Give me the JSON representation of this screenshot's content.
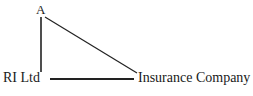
{
  "diagram": {
    "type": "triangle-relationship-diagram",
    "background_color": "#ffffff",
    "stroke_color": "#222222",
    "nodes": [
      {
        "id": "apex",
        "label": "A",
        "x": 41,
        "y": 10
      },
      {
        "id": "ri-ltd",
        "label": "RI Ltd",
        "x": 24,
        "y": 79
      },
      {
        "id": "insurance-company",
        "label": "Insurance Company",
        "x": 192,
        "y": 79
      }
    ],
    "edges": [
      {
        "id": "apex-to-ri-ltd",
        "from": "apex",
        "to": "ri-ltd",
        "x1": 41,
        "y1": 17,
        "x2": 41,
        "y2": 72,
        "width": 1.6
      },
      {
        "id": "apex-to-insurance-company",
        "from": "apex",
        "to": "insurance-company",
        "x1": 45,
        "y1": 17,
        "x2": 137,
        "y2": 73,
        "width": 1.2
      },
      {
        "id": "ri-ltd-to-insurance-company",
        "from": "ri-ltd",
        "to": "insurance-company",
        "x1": 50,
        "y1": 79,
        "x2": 134,
        "y2": 79,
        "width": 1.8
      }
    ]
  }
}
